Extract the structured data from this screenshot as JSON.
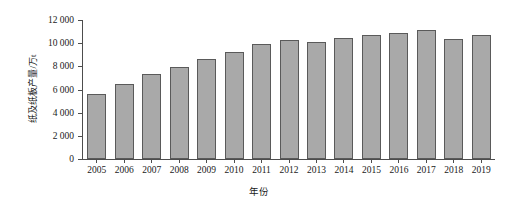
{
  "chart_data": {
    "type": "bar",
    "title": "",
    "xlabel": "年份",
    "ylabel": "纸及纸板产量/万t",
    "categories": [
      "2005",
      "2006",
      "2007",
      "2008",
      "2009",
      "2010",
      "2011",
      "2012",
      "2013",
      "2014",
      "2015",
      "2016",
      "2017",
      "2018",
      "2019"
    ],
    "values": [
      5600,
      6500,
      7350,
      7980,
      8640,
      9270,
      9930,
      10250,
      10100,
      10470,
      10710,
      10850,
      11130,
      10350,
      10720
    ],
    "ylim": [
      0,
      12000
    ],
    "yticks": [
      0,
      2000,
      4000,
      6000,
      8000,
      10000,
      12000
    ],
    "ytick_labels": [
      "0",
      "2 000",
      "4 000",
      "6 000",
      "8 000",
      "10 000",
      "12 000"
    ],
    "grid": false,
    "legend": false,
    "series_color": "#a9a9a9",
    "series_border_color": "#5a5a5a",
    "axis_color": "#4d4d4d",
    "background": "#ffffff"
  }
}
